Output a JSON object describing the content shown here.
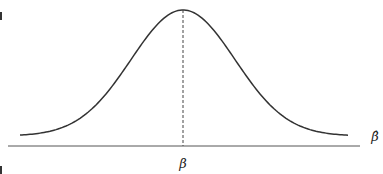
{
  "chart_data": {
    "type": "line",
    "title": "",
    "xlabel": "β̂",
    "ylabel": "",
    "center_label": "β",
    "center_marker": "dashed vertical line at mean",
    "distribution": "normal",
    "grid": false,
    "legend": null
  },
  "labels": {
    "x_axis": "β̂",
    "center": "β"
  },
  "colors": {
    "curve": "#333333",
    "axis": "#555555",
    "background": "#ffffff"
  }
}
